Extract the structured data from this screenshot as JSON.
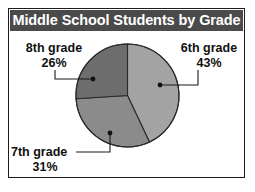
{
  "figure": {
    "title": "Middle School Students by Grade",
    "frame_color": "#1b1b1b",
    "title_bar_color": "#4a4a4a",
    "title_text_color": "#ffffff",
    "background_color": "#ffffff"
  },
  "chart_data": {
    "type": "pie",
    "title": "Middle School Students by Grade",
    "xlabel": "",
    "ylabel": "",
    "legend_position": "none",
    "grid": false,
    "start_angle_deg": 90,
    "direction": "clockwise",
    "categories": [
      "6th grade",
      "7th grade",
      "8th grade"
    ],
    "values": [
      43,
      31,
      26
    ],
    "value_unit": "%",
    "slices": [
      {
        "label": "6th grade",
        "value": 43,
        "percent_text": "43%",
        "color": "#a3a3a3",
        "sweep_deg": 154.8
      },
      {
        "label": "7th grade",
        "value": 31,
        "percent_text": "31%",
        "color": "#8b8b8b",
        "sweep_deg": 111.6
      },
      {
        "label": "8th grade",
        "value": 26,
        "percent_text": "26%",
        "color": "#6d6d6d",
        "sweep_deg": 93.6
      }
    ],
    "annotations": [
      {
        "text": "6th grade",
        "percent": "43%"
      },
      {
        "text": "7th grade",
        "percent": "31%"
      },
      {
        "text": "8th grade",
        "percent": "26%"
      }
    ]
  },
  "labels": {
    "sixth": {
      "name": "6th grade",
      "percent": "43%"
    },
    "seventh": {
      "name": "7th grade",
      "percent": "31%"
    },
    "eighth": {
      "name": "8th grade",
      "percent": "26%"
    }
  }
}
